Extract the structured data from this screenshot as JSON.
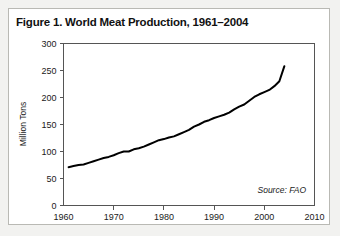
{
  "figure": {
    "title": "Figure 1. World Meat Production, 1961–2004",
    "source_note": "Source: FAO",
    "card_background": "#ffffff",
    "page_background": "#f2f2f0",
    "border_color": "#b9b9b4"
  },
  "chart_data": {
    "type": "line",
    "title": "Figure 1. World Meat Production, 1961–2004",
    "xlabel": "",
    "ylabel": "Million Tons",
    "xlim": [
      1960,
      2010
    ],
    "ylim": [
      0,
      300
    ],
    "xticks": [
      1960,
      1970,
      1980,
      1990,
      2000,
      2010
    ],
    "yticks": [
      0,
      50,
      100,
      150,
      200,
      250,
      300
    ],
    "xtick_labels": [
      "1960",
      "1970",
      "1980",
      "1990",
      "2000",
      "2010"
    ],
    "ytick_labels": [
      "0",
      "50",
      "100",
      "150",
      "200",
      "250",
      "300"
    ],
    "grid": false,
    "legend": null,
    "line_color": "#000000",
    "annotations": [
      {
        "text": "Source: FAO",
        "position": "inside-bottom-right",
        "style": "italic"
      }
    ],
    "series": [
      {
        "name": "World Meat Production",
        "units": "Million Tons",
        "x": [
          1961,
          1962,
          1963,
          1964,
          1965,
          1966,
          1967,
          1968,
          1969,
          1970,
          1971,
          1972,
          1973,
          1974,
          1975,
          1976,
          1977,
          1978,
          1979,
          1980,
          1981,
          1982,
          1983,
          1984,
          1985,
          1986,
          1987,
          1988,
          1989,
          1990,
          1991,
          1992,
          1993,
          1994,
          1995,
          1996,
          1997,
          1998,
          1999,
          2000,
          2001,
          2002,
          2003,
          2004
        ],
        "values": [
          71,
          73,
          75,
          76,
          79,
          82,
          85,
          88,
          90,
          93,
          97,
          100,
          100,
          104,
          106,
          109,
          113,
          117,
          121,
          123,
          126,
          128,
          132,
          136,
          140,
          146,
          150,
          155,
          158,
          162,
          165,
          168,
          172,
          178,
          183,
          187,
          194,
          201,
          206,
          210,
          214,
          221,
          230,
          258
        ]
      }
    ]
  }
}
